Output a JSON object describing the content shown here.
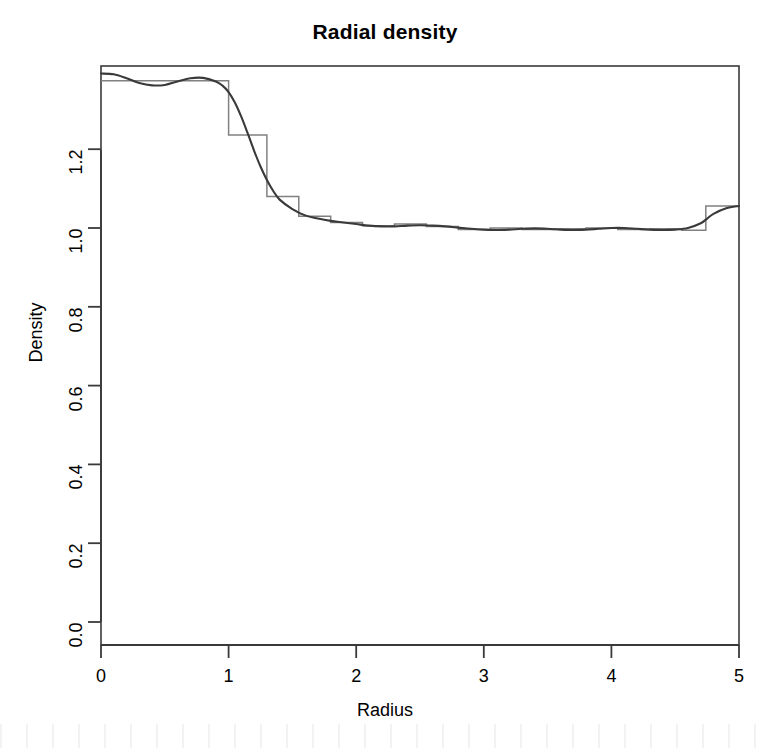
{
  "chart_data": {
    "type": "line",
    "title": "Radial density",
    "xlabel": "Radius",
    "ylabel": "Density",
    "xlim": [
      0,
      5
    ],
    "ylim": [
      0,
      1.45
    ],
    "grid": false,
    "legend": "none",
    "xticks": [
      "0",
      "1",
      "2",
      "3",
      "4",
      "5"
    ],
    "xtick_values": [
      0,
      1,
      2,
      3,
      4,
      5
    ],
    "yticks": [
      "0.0",
      "0.2",
      "0.4",
      "0.6",
      "0.8",
      "1.0",
      "1.2"
    ],
    "ytick_values": [
      0.0,
      0.2,
      0.4,
      0.6,
      0.8,
      1.0,
      1.2
    ],
    "series": [
      {
        "name": "smooth estimate",
        "style": "solid-dark",
        "color": "#3a3a3a",
        "x": [
          0.0,
          0.1,
          0.2,
          0.3,
          0.4,
          0.5,
          0.6,
          0.7,
          0.8,
          0.9,
          0.95,
          1.0,
          1.05,
          1.1,
          1.15,
          1.2,
          1.25,
          1.3,
          1.35,
          1.4,
          1.5,
          1.6,
          1.7,
          1.8,
          1.9,
          2.0,
          2.1,
          2.2,
          2.3,
          2.4,
          2.5,
          2.6,
          2.7,
          2.8,
          2.9,
          3.0,
          3.1,
          3.2,
          3.3,
          3.4,
          3.5,
          3.6,
          3.7,
          3.8,
          3.9,
          4.0,
          4.1,
          4.2,
          4.3,
          4.4,
          4.5,
          4.6,
          4.7,
          4.75,
          4.8,
          4.9,
          5.0
        ],
        "y": [
          1.392,
          1.39,
          1.38,
          1.368,
          1.362,
          1.363,
          1.372,
          1.38,
          1.381,
          1.372,
          1.362,
          1.345,
          1.318,
          1.282,
          1.24,
          1.196,
          1.156,
          1.122,
          1.094,
          1.072,
          1.048,
          1.032,
          1.024,
          1.018,
          1.014,
          1.01,
          1.006,
          1.004,
          1.004,
          1.006,
          1.007,
          1.006,
          1.004,
          1.001,
          0.998,
          0.996,
          0.995,
          0.996,
          0.998,
          0.999,
          0.998,
          0.996,
          0.995,
          0.996,
          0.998,
          1.0,
          1.0,
          0.998,
          0.996,
          0.995,
          0.996,
          1.0,
          1.012,
          1.024,
          1.036,
          1.05,
          1.056
        ]
      },
      {
        "name": "histogram / step estimate",
        "style": "step",
        "color": "#808080",
        "x": [
          0.0,
          1.0,
          1.0,
          1.3,
          1.3,
          1.55,
          1.55,
          1.8,
          1.8,
          2.05,
          2.05,
          2.3,
          2.3,
          2.55,
          2.55,
          2.8,
          2.8,
          3.05,
          3.05,
          3.3,
          3.3,
          3.55,
          3.55,
          3.8,
          3.8,
          4.05,
          4.05,
          4.3,
          4.3,
          4.55,
          4.55,
          4.74,
          4.74,
          5.0
        ],
        "y": [
          1.374,
          1.374,
          1.236,
          1.236,
          1.08,
          1.08,
          1.03,
          1.03,
          1.014,
          1.014,
          1.006,
          1.006,
          1.01,
          1.01,
          1.004,
          1.004,
          0.996,
          0.996,
          1.0,
          1.0,
          0.996,
          0.996,
          0.998,
          0.998,
          1.0,
          1.0,
          0.996,
          0.996,
          0.998,
          0.998,
          0.994,
          0.994,
          1.056,
          1.056
        ]
      }
    ]
  },
  "figure": {
    "background_color": "#ffffff",
    "axis_color": "#3a3a3a",
    "box_frame": true
  }
}
